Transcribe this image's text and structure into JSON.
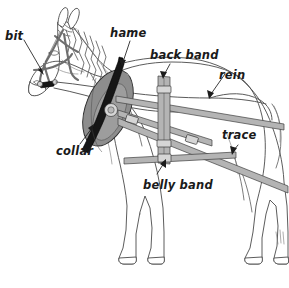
{
  "diagram": {
    "background_color": "#ffffff",
    "label_color": "#1a1a1a",
    "strap_color": "#b4b4b4",
    "collar_color": "#8d8d8d",
    "hame_color": "#161616",
    "outline_color": "#4a4a4a",
    "labels": [
      {
        "id": "bit",
        "text": "bit",
        "x": 5,
        "y": 31,
        "target_x": 44,
        "target_y": 74,
        "description": "mouthpiece of the bridle at the horse's mouth"
      },
      {
        "id": "hame",
        "text": "hame",
        "x": 110,
        "y": 28,
        "target_x": 122,
        "target_y": 66,
        "description": "rigid bar along the face of the collar"
      },
      {
        "id": "back-band",
        "text": "back band",
        "x": 150,
        "y": 50,
        "target_x": 163,
        "target_y": 78,
        "description": "vertical strap over the back supporting the shafts"
      },
      {
        "id": "rein",
        "text": "rein",
        "x": 219,
        "y": 70,
        "target_x": 210,
        "target_y": 98,
        "description": "long line from the bit back to the driver"
      },
      {
        "id": "trace",
        "text": "trace",
        "x": 222,
        "y": 130,
        "target_x": 232,
        "target_y": 152,
        "description": "draught strap transmitting pull from collar to load"
      },
      {
        "id": "collar",
        "text": "collar",
        "x": 56,
        "y": 146,
        "target_x": 92,
        "target_y": 126,
        "description": "padded oval ring around the neck and shoulders"
      },
      {
        "id": "belly-band",
        "text": "belly band",
        "x": 143,
        "y": 180,
        "target_x": 164,
        "target_y": 160,
        "description": "strap passing under the belly"
      }
    ]
  }
}
